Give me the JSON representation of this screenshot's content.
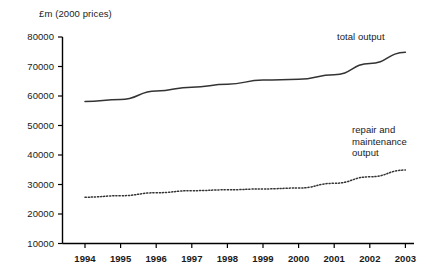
{
  "chart_data": {
    "type": "line",
    "title": "£m (2000 prices)",
    "xlabel": "",
    "ylabel": "£m (2000 prices)",
    "x": [
      1994,
      1995,
      1996,
      1997,
      1998,
      1999,
      2000,
      2001,
      2002,
      2003
    ],
    "categories": [
      "1994",
      "1995",
      "1996",
      "1997",
      "1998",
      "1999",
      "2000",
      "2001",
      "2002",
      "2003"
    ],
    "ylim": [
      10000,
      80000
    ],
    "yticks": [
      10000,
      20000,
      30000,
      40000,
      50000,
      60000,
      70000,
      80000
    ],
    "ytick_labels": [
      "10000",
      "20000",
      "30000",
      "40000",
      "50000",
      "60000",
      "70000",
      "80000"
    ],
    "grid": false,
    "legend_position": "inline-annotation",
    "series": [
      {
        "name": "total output",
        "style": "solid",
        "color": "#333333",
        "values": [
          58100,
          58800,
          61700,
          63000,
          64000,
          65400,
          65700,
          67200,
          71000,
          74800
        ]
      },
      {
        "name": "repair and maintenance output",
        "style": "dotted",
        "color": "#333333",
        "values": [
          25700,
          26200,
          27200,
          27900,
          28200,
          28500,
          28800,
          30400,
          32600,
          34900
        ]
      }
    ],
    "annotations": [
      {
        "text": "total output",
        "series": "total output"
      },
      {
        "text": "repair and\nmaintenance\noutput",
        "series": "repair and maintenance output"
      }
    ]
  },
  "axis": {
    "title": "£m (2000 prices)",
    "y_labels": [
      "80000",
      "70000",
      "60000",
      "50000",
      "40000",
      "30000",
      "20000",
      "10000"
    ],
    "x_labels": [
      "1994",
      "1995",
      "1996",
      "1997",
      "1998",
      "1999",
      "2000",
      "2001",
      "2002",
      "2003"
    ]
  },
  "annotations": {
    "total_output": "total output",
    "repair_maintenance": "repair and\nmaintenance\noutput"
  },
  "colors": {
    "line": "#333333",
    "axis": "#000000",
    "background": "#ffffff",
    "text": "#1a1a1a"
  }
}
